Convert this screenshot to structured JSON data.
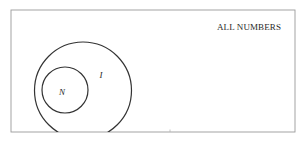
{
  "diagram": {
    "type": "venn",
    "universe": {
      "label": "ALL NUMBERS",
      "border_color": "#9a9a9a"
    },
    "sets": [
      {
        "id": "I",
        "label": "I",
        "contains": [
          "N"
        ],
        "stroke": "#333333"
      },
      {
        "id": "N",
        "label": "N",
        "stroke": "#333333"
      }
    ]
  }
}
